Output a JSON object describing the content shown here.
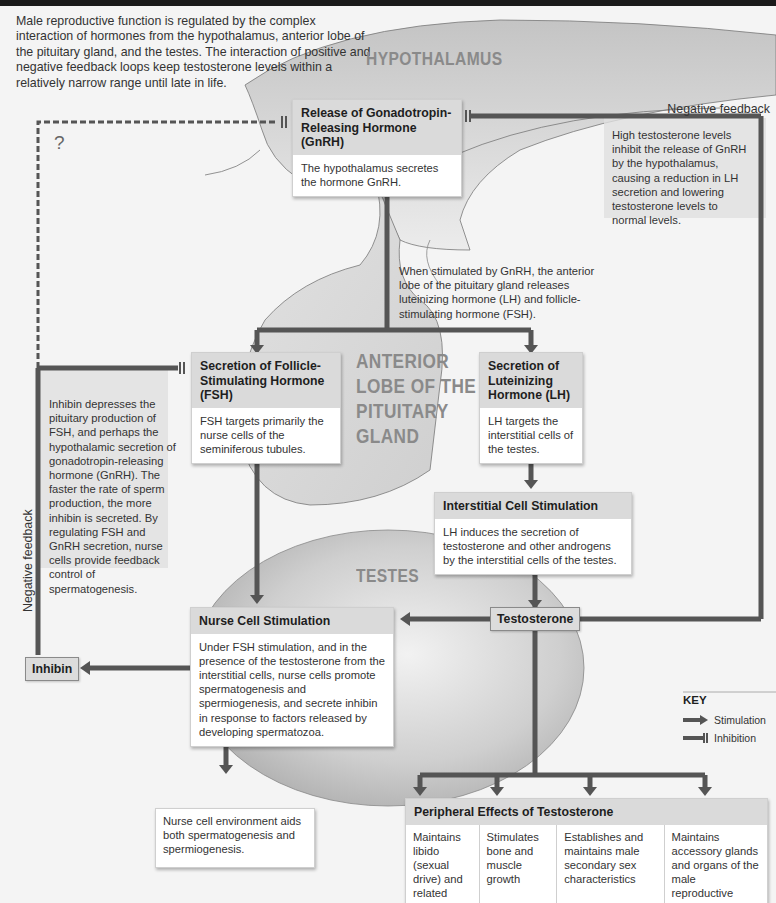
{
  "intro": "Male reproductive function is regulated by the complex interaction of hormones from the hypothalamus, anterior lobe of the pituitary gland, and the testes. The interaction of positive and negative feedback loops keep testosterone levels within a relatively narrow range until late in life.",
  "regions": {
    "hypothalamus": "HYPOTHALAMUS",
    "pituitary": [
      "ANTERIOR",
      "LOBE OF THE",
      "PITUITARY",
      "GLAND"
    ],
    "testes": "TESTES"
  },
  "boxes": {
    "gnrh": {
      "title": "Release of Gonadotropin-Releasing Hormone (GnRH)",
      "body": "The hypothalamus secretes the hormone GnRH."
    },
    "fsh": {
      "title": "Secretion of Follicle-Stimulating Hormone (FSH)",
      "body": "FSH targets primarily the nurse cells of the seminiferous tubules."
    },
    "lh": {
      "title": "Secretion of Luteinizing Hormone (LH)",
      "body": "LH targets the interstitial cells of the testes."
    },
    "interstitial": {
      "title": "Interstitial Cell Stimulation",
      "body": "LH induces the secretion of testosterone and other androgens by the interstitial cells of the testes."
    },
    "nurse": {
      "title": "Nurse Cell Stimulation",
      "body": "Under FSH stimulation, and in the presence of the testosterone from the interstitial cells, nurse cells promote spermatogenesis and spermiogenesis, and secrete inhibin in response to factors released by developing spermatozoa."
    },
    "nurse_env": {
      "body": "Nurse cell environment aids both spermatogenesis and spermiogenesis."
    }
  },
  "tags": {
    "testosterone": "Testosterone",
    "inhibin": "Inhibin"
  },
  "annotations": {
    "pituitary_release": "When stimulated by GnRH, the anterior lobe of the pituitary gland releases luteinizing hormone (LH) and follicle-stimulating hormone (FSH).",
    "testosterone_feedback": "High testosterone levels inhibit the release of GnRH by the hypothalamus, causing a reduction in LH secretion and lowering testosterone levels to normal levels.",
    "inhibin_feedback": "Inhibin depresses the pituitary production of FSH, and perhaps the hypothalamic secretion of gonadotropin-releasing hormone (GnRH).  The faster the rate of sperm production, the more inhibin is secreted. By regulating FSH and GnRH secretion, nurse cells provide feedback control of spermatogenesis.",
    "negative_feedback_right": "Negative feedback",
    "negative_feedback_left": "Negative feedback",
    "unknown_mark": "?"
  },
  "peripheral": {
    "title": "Peripheral Effects of Testosterone",
    "effects": [
      "Maintains libido (sexual drive) and related behaviors",
      "Stimulates bone and muscle growth",
      "Establishes and maintains male secondary sex characteristics",
      "Maintains accessory glands and organs of the male reproductive system"
    ]
  },
  "key": {
    "title": "KEY",
    "items": [
      {
        "symbol": "arrow",
        "label": "Stimulation"
      },
      {
        "symbol": "bar",
        "label": "Inhibition"
      }
    ]
  },
  "colors": {
    "arrow": "#555555",
    "organ_fill": "#c8c8c8",
    "box_header": "#dadada"
  }
}
